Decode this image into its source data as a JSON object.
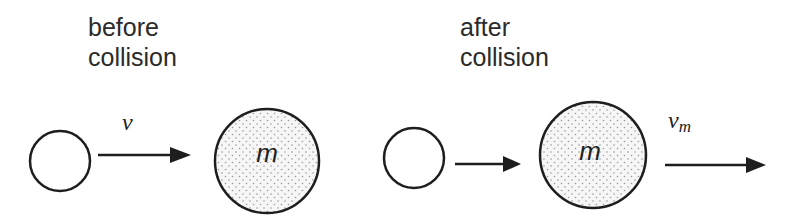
{
  "diagram": {
    "type": "elastic collision schematic",
    "panels": [
      {
        "id": "before",
        "caption_line1": "before",
        "caption_line2": "collision",
        "small_ball": {
          "filled": false
        },
        "velocity_arrow": {
          "label": "v"
        },
        "large_ball": {
          "label": "m",
          "fill": "stippled gray"
        }
      },
      {
        "id": "after",
        "caption_line1": "after",
        "caption_line2": "collision",
        "small_ball": {
          "filled": false
        },
        "small_ball_arrow": {
          "label": ""
        },
        "large_ball": {
          "label": "m",
          "fill": "stippled gray"
        },
        "large_ball_arrow": {
          "label_base": "v",
          "label_sub": "m"
        }
      }
    ],
    "colors": {
      "stroke": "#1e1e1e",
      "stipple_dot": "#9a9a9a",
      "text": "#2a2a2a",
      "background": "#ffffff"
    }
  }
}
